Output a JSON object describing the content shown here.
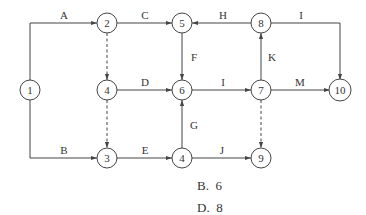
{
  "diagram": {
    "nodes": [
      {
        "id": "n1",
        "label": "1",
        "x": 30,
        "y": 90
      },
      {
        "id": "n2",
        "label": "2",
        "x": 107,
        "y": 23
      },
      {
        "id": "n5",
        "label": "5",
        "x": 182,
        "y": 23
      },
      {
        "id": "n8",
        "label": "8",
        "x": 261,
        "y": 23
      },
      {
        "id": "n4a",
        "label": "4",
        "x": 107,
        "y": 90
      },
      {
        "id": "n6",
        "label": "6",
        "x": 182,
        "y": 90
      },
      {
        "id": "n7",
        "label": "7",
        "x": 261,
        "y": 90
      },
      {
        "id": "n10",
        "label": "10",
        "x": 340,
        "y": 90
      },
      {
        "id": "n3",
        "label": "3",
        "x": 107,
        "y": 158
      },
      {
        "id": "n4b",
        "label": "4",
        "x": 182,
        "y": 158
      },
      {
        "id": "n9",
        "label": "9",
        "x": 261,
        "y": 158
      }
    ],
    "edges": [
      {
        "id": "A",
        "label": "A",
        "from": "1",
        "to": "2",
        "dashed": false
      },
      {
        "id": "B",
        "label": "B",
        "from": "1",
        "to": "3",
        "dashed": false
      },
      {
        "id": "C",
        "label": "C",
        "from": "2",
        "to": "5",
        "dashed": false
      },
      {
        "id": "D",
        "label": "D",
        "from": "4",
        "to": "6",
        "dashed": false
      },
      {
        "id": "E",
        "label": "E",
        "from": "3",
        "to": "4",
        "dashed": false
      },
      {
        "id": "F",
        "label": "F",
        "from": "5",
        "to": "6",
        "dashed": false
      },
      {
        "id": "G",
        "label": "G",
        "from": "4",
        "to": "6",
        "dashed": false
      },
      {
        "id": "H",
        "label": "H",
        "from": "8",
        "to": "5",
        "dashed": false
      },
      {
        "id": "I1",
        "label": "I",
        "from": "8",
        "to": "10",
        "dashed": false
      },
      {
        "id": "I2",
        "label": "I",
        "from": "6",
        "to": "7",
        "dashed": false
      },
      {
        "id": "J",
        "label": "J",
        "from": "4",
        "to": "9",
        "dashed": false
      },
      {
        "id": "K",
        "label": "K",
        "from": "7",
        "to": "8",
        "dashed": false
      },
      {
        "id": "M",
        "label": "M",
        "from": "7",
        "to": "10",
        "dashed": false
      },
      {
        "id": "d24",
        "label": "",
        "from": "2",
        "to": "4",
        "dashed": true
      },
      {
        "id": "d43",
        "label": "",
        "from": "4",
        "to": "3",
        "dashed": true
      },
      {
        "id": "d79",
        "label": "",
        "from": "7",
        "to": "9",
        "dashed": true
      }
    ]
  },
  "answers": [
    {
      "label": "B.  6"
    },
    {
      "label": "D.  8"
    }
  ]
}
